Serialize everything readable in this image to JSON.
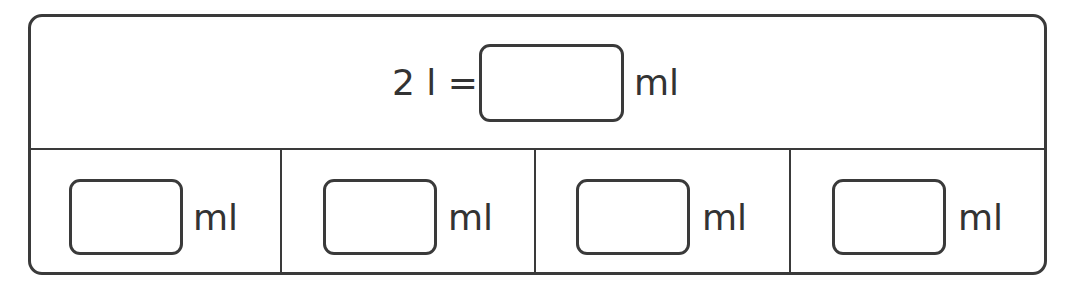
{
  "question": {
    "lhs": "2 l =",
    "unit": "ml",
    "answer_value": ""
  },
  "options": [
    {
      "value": "",
      "unit": "ml"
    },
    {
      "value": "",
      "unit": "ml"
    },
    {
      "value": "",
      "unit": "ml"
    },
    {
      "value": "",
      "unit": "ml"
    }
  ],
  "colors": {
    "stroke": "#3a3a3a",
    "text": "#333333",
    "background": "#ffffff"
  }
}
